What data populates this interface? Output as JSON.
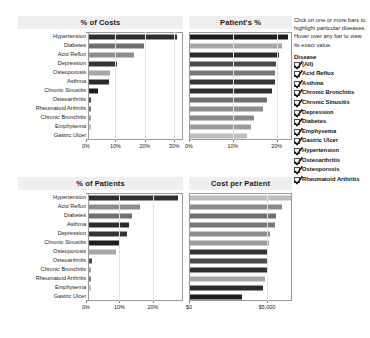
{
  "layout": {
    "title_bar_color": "#efefef",
    "axis_color": "#9a9a9a",
    "grid_color": "#e2e2e2"
  },
  "info": {
    "help_text": "Click on one or more bars to highlight particular diseases. Hover over any bar to view its exact value.",
    "legend_title": "Disease",
    "items": [
      {
        "label": "(All)",
        "checked": true,
        "color": "#b8b8b8"
      },
      {
        "label": "Acid Reflux",
        "checked": true,
        "color": "#8d8d8d"
      },
      {
        "label": "Asthma",
        "checked": true,
        "color": "#2b2b2b"
      },
      {
        "label": "Chronic Bronchitis",
        "checked": true,
        "color": "#9c9c9c"
      },
      {
        "label": "Chronic Sinusitis",
        "checked": true,
        "color": "#1f1f1f"
      },
      {
        "label": "Depression",
        "checked": true,
        "color": "#353535"
      },
      {
        "label": "Diabetes",
        "checked": true,
        "color": "#6f6f6f"
      },
      {
        "label": "Emphysema",
        "checked": true,
        "color": "#bdbdbd"
      },
      {
        "label": "Gastric Ulcer",
        "checked": true,
        "color": "#8a8a8a"
      },
      {
        "label": "Hypertension",
        "checked": true,
        "color": "#2f2f2f"
      },
      {
        "label": "Osteoarthritis",
        "checked": true,
        "color": "#4a4a4a"
      },
      {
        "label": "Osteoporosis",
        "checked": true,
        "color": "#a6a6a6"
      },
      {
        "label": "Rheumatoid Arthritis",
        "checked": true,
        "color": "#787878"
      }
    ]
  },
  "chart_data": [
    {
      "id": "pct-of-costs",
      "type": "bar",
      "orientation": "horizontal",
      "title": "% of Costs",
      "xlabel": "",
      "ylabel": "",
      "xlim": [
        0,
        33
      ],
      "ticks": [
        0,
        10,
        20,
        30
      ],
      "tick_labels": [
        "0%",
        "10%",
        "20%",
        "30%"
      ],
      "grid": true,
      "legend": "right",
      "categories": [
        "Hypertension",
        "Diabetes",
        "Acid Reflux",
        "Depression",
        "Osteoporosis",
        "Asthma",
        "Chronic Sinusitis",
        "Osteoarthritis",
        "Rheumatoid Arthritis",
        "Chronic Bronchitis",
        "Emphysema",
        "Gastric Ulcer"
      ],
      "values": [
        29.8,
        18.7,
        15.2,
        9.6,
        7.2,
        6.7,
        3.2,
        0.6,
        0.5,
        0.5,
        0.2,
        0.0
      ],
      "colors": [
        "#2f2f2f",
        "#6f6f6f",
        "#8d8d8d",
        "#353535",
        "#a6a6a6",
        "#2b2b2b",
        "#1f1f1f",
        "#4a4a4a",
        "#787878",
        "#9c9c9c",
        "#bdbdbd",
        "#8a8a8a"
      ]
    },
    {
      "id": "patients-pct",
      "type": "bar",
      "orientation": "horizontal",
      "title": "Patient's %",
      "xlabel": "",
      "ylabel": "",
      "xlim": [
        0,
        23.5
      ],
      "ticks": [
        0,
        10,
        20
      ],
      "tick_labels": [
        "0%",
        "10%",
        "20%"
      ],
      "grid": true,
      "legend": "right",
      "categories": [
        "Chronic Sinusitis",
        "Osteoporosis",
        "Asthma",
        "Osteoarthritis",
        "Rheumatoid Arthritis",
        "Depression",
        "Hypertension",
        "Diabetes",
        "Acid Reflux",
        "Gastric Ulcer",
        "Chronic Bronchitis",
        "Emphysema"
      ],
      "values": [
        22.4,
        21.1,
        20.4,
        19.6,
        19.5,
        19.3,
        18.8,
        17.6,
        16.6,
        14.6,
        13.9,
        13.0
      ],
      "colors": [
        "#1f1f1f",
        "#a6a6a6",
        "#2b2b2b",
        "#4a4a4a",
        "#787878",
        "#353535",
        "#2f2f2f",
        "#6f6f6f",
        "#8d8d8d",
        "#8a8a8a",
        "#9c9c9c",
        "#bdbdbd"
      ]
    },
    {
      "id": "pct-of-patients",
      "type": "bar",
      "orientation": "horizontal",
      "title": "% of Patients",
      "xlabel": "",
      "ylabel": "",
      "xlim": [
        0,
        29
      ],
      "ticks": [
        0,
        10,
        20
      ],
      "tick_labels": [
        "0%",
        "10%",
        "20%"
      ],
      "grid": true,
      "legend": "right",
      "categories": [
        "Hypertension",
        "Acid Reflux",
        "Diabetes",
        "Asthma",
        "Depression",
        "Chronic Sinusitis",
        "Osteoporosis",
        "Osteoarthritis",
        "Chronic Bronchitis",
        "Rheumatoid Arthritis",
        "Emphysema",
        "Gastric Ulcer"
      ],
      "values": [
        26.5,
        15.3,
        12.9,
        12.0,
        11.5,
        9.0,
        8.0,
        0.8,
        0.6,
        0.6,
        0.2,
        0.0
      ],
      "colors": [
        "#2f2f2f",
        "#8d8d8d",
        "#6f6f6f",
        "#2b2b2b",
        "#353535",
        "#1f1f1f",
        "#a6a6a6",
        "#4a4a4a",
        "#9c9c9c",
        "#787878",
        "#bdbdbd",
        "#8a8a8a"
      ]
    },
    {
      "id": "cost-per-patient",
      "type": "bar",
      "orientation": "horizontal",
      "title": "Cost per Patient",
      "xlabel": "",
      "ylabel": "",
      "xlim": [
        0,
        6600
      ],
      "ticks": [
        0,
        5000
      ],
      "tick_labels": [
        "$0",
        "$5,000"
      ],
      "grid": true,
      "legend": "right",
      "categories": [
        "Emphysema",
        "Gastric Ulcer",
        "Diabetes",
        "Rheumatoid Arthritis",
        "Acid Reflux",
        "Chronic Bronchitis",
        "Depression",
        "Osteoarthritis",
        "Hypertension",
        "Osteoporosis",
        "Asthma",
        "Chronic Sinusitis"
      ],
      "values": [
        6450,
        5900,
        5500,
        5450,
        5150,
        5050,
        5000,
        4980,
        4960,
        4800,
        4700,
        3300
      ],
      "colors": [
        "#bdbdbd",
        "#8a8a8a",
        "#6f6f6f",
        "#787878",
        "#8d8d8d",
        "#9c9c9c",
        "#353535",
        "#4a4a4a",
        "#2f2f2f",
        "#a6a6a6",
        "#2b2b2b",
        "#1f1f1f"
      ]
    }
  ]
}
